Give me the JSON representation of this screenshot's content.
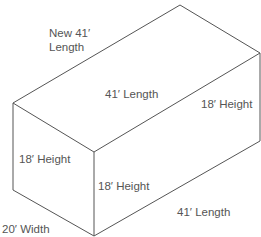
{
  "diagram": {
    "type": "isometric-box",
    "line_color": "#555555",
    "text_color": "#555555",
    "vertices": {
      "left_top": [
        13,
        103
      ],
      "back_top": [
        180,
        5
      ],
      "right_top": [
        260,
        53
      ],
      "front_top": [
        94,
        152
      ],
      "front_bottom": [
        94,
        236
      ],
      "left_bottom": [
        13,
        190
      ],
      "right_bottom": [
        260,
        141
      ]
    },
    "labels": {
      "new_length_line1": "New 41′",
      "new_length_line2": "Length",
      "top_length": "41′ Length",
      "right_height": "18′ Height",
      "left_height": "18′ Height",
      "front_height": "18′ Height",
      "bottom_length": "41′ Length",
      "width": "20′ Width"
    }
  }
}
